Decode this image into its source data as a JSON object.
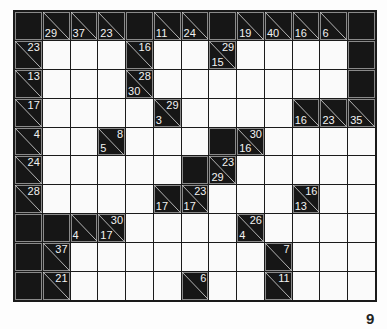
{
  "puzzle": {
    "type": "kakuro",
    "columns": 13,
    "rows": 10,
    "cells": [
      [
        {
          "t": "b"
        },
        {
          "t": "c",
          "d": "29"
        },
        {
          "t": "c",
          "d": "37"
        },
        {
          "t": "c",
          "d": "23"
        },
        {
          "t": "b"
        },
        {
          "t": "c",
          "d": "11"
        },
        {
          "t": "c",
          "d": "24"
        },
        {
          "t": "b"
        },
        {
          "t": "c",
          "d": "19"
        },
        {
          "t": "c",
          "d": "40"
        },
        {
          "t": "c",
          "d": "16"
        },
        {
          "t": "c",
          "d": "6"
        },
        {
          "t": "b"
        }
      ],
      [
        {
          "t": "c",
          "a": "23"
        },
        {
          "t": "w"
        },
        {
          "t": "w"
        },
        {
          "t": "w"
        },
        {
          "t": "c",
          "a": "16"
        },
        {
          "t": "w"
        },
        {
          "t": "w"
        },
        {
          "t": "c",
          "a": "29",
          "d": "15"
        },
        {
          "t": "w"
        },
        {
          "t": "w"
        },
        {
          "t": "w"
        },
        {
          "t": "w"
        },
        {
          "t": "b"
        }
      ],
      [
        {
          "t": "c",
          "a": "13"
        },
        {
          "t": "w"
        },
        {
          "t": "w"
        },
        {
          "t": "w"
        },
        {
          "t": "c",
          "a": "28",
          "d": "30"
        },
        {
          "t": "w"
        },
        {
          "t": "w"
        },
        {
          "t": "w"
        },
        {
          "t": "w"
        },
        {
          "t": "w"
        },
        {
          "t": "w"
        },
        {
          "t": "w"
        },
        {
          "t": "b"
        }
      ],
      [
        {
          "t": "c",
          "a": "17"
        },
        {
          "t": "w"
        },
        {
          "t": "w"
        },
        {
          "t": "w"
        },
        {
          "t": "w"
        },
        {
          "t": "c",
          "a": "29",
          "d": "3"
        },
        {
          "t": "w"
        },
        {
          "t": "w"
        },
        {
          "t": "w"
        },
        {
          "t": "w"
        },
        {
          "t": "c",
          "d": "16"
        },
        {
          "t": "c",
          "d": "23"
        },
        {
          "t": "c",
          "d": "35"
        }
      ],
      [
        {
          "t": "c",
          "a": "4"
        },
        {
          "t": "w"
        },
        {
          "t": "w"
        },
        {
          "t": "c",
          "a": "8",
          "d": "5"
        },
        {
          "t": "w"
        },
        {
          "t": "w"
        },
        {
          "t": "w"
        },
        {
          "t": "b"
        },
        {
          "t": "c",
          "a": "30",
          "d": "16"
        },
        {
          "t": "w"
        },
        {
          "t": "w"
        },
        {
          "t": "w"
        },
        {
          "t": "w"
        }
      ],
      [
        {
          "t": "c",
          "a": "24"
        },
        {
          "t": "w"
        },
        {
          "t": "w"
        },
        {
          "t": "w"
        },
        {
          "t": "w"
        },
        {
          "t": "w"
        },
        {
          "t": "b"
        },
        {
          "t": "c",
          "a": "23",
          "d": "29"
        },
        {
          "t": "w"
        },
        {
          "t": "w"
        },
        {
          "t": "w"
        },
        {
          "t": "w"
        },
        {
          "t": "w"
        }
      ],
      [
        {
          "t": "c",
          "a": "28"
        },
        {
          "t": "w"
        },
        {
          "t": "w"
        },
        {
          "t": "w"
        },
        {
          "t": "w"
        },
        {
          "t": "c",
          "d": "17"
        },
        {
          "t": "c",
          "a": "23",
          "d": "17"
        },
        {
          "t": "w"
        },
        {
          "t": "w"
        },
        {
          "t": "w"
        },
        {
          "t": "c",
          "a": "16",
          "d": "13"
        },
        {
          "t": "w"
        },
        {
          "t": "w"
        }
      ],
      [
        {
          "t": "b"
        },
        {
          "t": "b"
        },
        {
          "t": "c",
          "d": "4"
        },
        {
          "t": "c",
          "a": "30",
          "d": "17"
        },
        {
          "t": "w"
        },
        {
          "t": "w"
        },
        {
          "t": "w"
        },
        {
          "t": "w"
        },
        {
          "t": "c",
          "a": "26",
          "d": "4"
        },
        {
          "t": "w"
        },
        {
          "t": "w"
        },
        {
          "t": "w"
        },
        {
          "t": "w"
        }
      ],
      [
        {
          "t": "b"
        },
        {
          "t": "c",
          "a": "37"
        },
        {
          "t": "w"
        },
        {
          "t": "w"
        },
        {
          "t": "w"
        },
        {
          "t": "w"
        },
        {
          "t": "w"
        },
        {
          "t": "w"
        },
        {
          "t": "w"
        },
        {
          "t": "c",
          "a": "7"
        },
        {
          "t": "w"
        },
        {
          "t": "w"
        },
        {
          "t": "w"
        }
      ],
      [
        {
          "t": "b"
        },
        {
          "t": "c",
          "a": "21"
        },
        {
          "t": "w"
        },
        {
          "t": "w"
        },
        {
          "t": "w"
        },
        {
          "t": "w"
        },
        {
          "t": "c",
          "a": "6"
        },
        {
          "t": "w"
        },
        {
          "t": "w"
        },
        {
          "t": "c",
          "a": "11"
        },
        {
          "t": "w"
        },
        {
          "t": "w"
        },
        {
          "t": "w"
        }
      ]
    ]
  },
  "page": {
    "number": "9"
  },
  "colors": {
    "block": "#161616",
    "white": "#fafafa",
    "line": "#1a1a1a",
    "clue_text": "#f2f2f2"
  }
}
